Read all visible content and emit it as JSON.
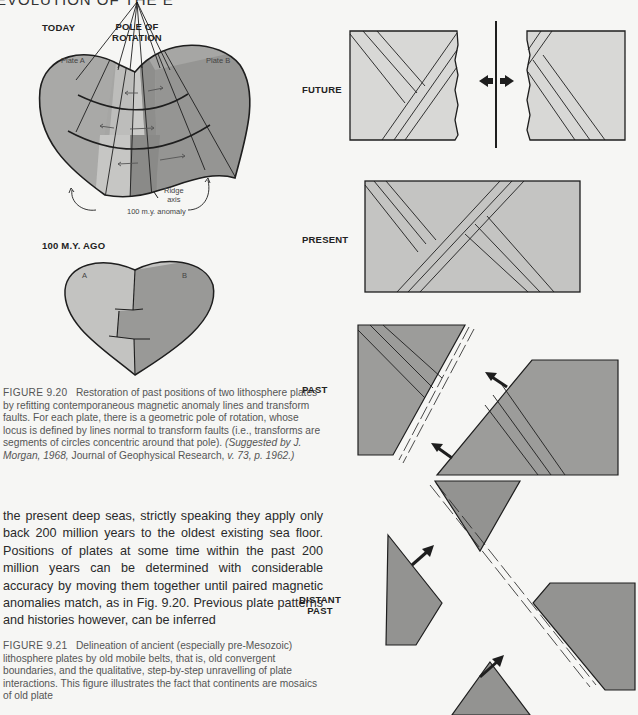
{
  "running_head": "EVOLUTION OF THE E",
  "figure_9_20": {
    "labels": {
      "today": "TODAY",
      "pole_of_rotation_line1": "POLE OF",
      "pole_of_rotation_line2": "ROTATION",
      "plate_a": "Plate A",
      "plate_b": "Plate B",
      "ridge_axis_line1": "Ridge",
      "ridge_axis_line2": "axis",
      "anomaly": "100 m.y. anomaly",
      "hundred_my_ago": "100 M.Y. AGO",
      "a": "A",
      "b": "B"
    },
    "caption": {
      "number": "FIGURE 9.20",
      "text": "Restoration of past positions of two lithosphere plates by refitting contemporaneous magnetic anomaly lines and transform faults. For each plate, there is a geometric pole of rotation, whose locus is defined by lines normal to transform faults (i.e., transforms are segments of circles concentric around that pole).",
      "credit_italic_1": "(Suggested by J. Morgan, 1968,",
      "credit_journal": "Journal of Geophysical Research,",
      "credit_italic_2": "v. 73, p. 1962.)"
    }
  },
  "body_text": "the present deep seas, strictly speaking they apply only back 200 million years to the oldest existing sea floor. Positions of plates at some time within the past 200 million years can be determined with considerable accuracy by moving them together until paired magnetic anomalies match, as in Fig. 9.20. Previous plate patterns and histories however, can be inferred",
  "figure_9_21": {
    "stage_labels": {
      "future": "FUTURE",
      "present": "PRESENT",
      "past": "PAST",
      "distant_past_line1": "DISTANT",
      "distant_past_line2": "PAST"
    },
    "caption": {
      "number": "FIGURE 9.21",
      "text": "Delineation of ancient (especially pre-Mesozoic) lithosphere plates by old mobile belts, that is, old convergent boundaries, and the qualitative, step-by-step unravelling of plate interactions. This figure illustrates the fact that continents are mosaics of old plate"
    }
  },
  "colors": {
    "page": "#f6f6f4",
    "plate_light": "#c8c8c6",
    "plate_mid": "#a9a9a7",
    "plate_dark": "#8f8f8d",
    "block_light": "#d9d9d7",
    "block_present": "#c4c4c2",
    "block_past": "#9c9c9a",
    "ink": "#1e1e1e"
  }
}
